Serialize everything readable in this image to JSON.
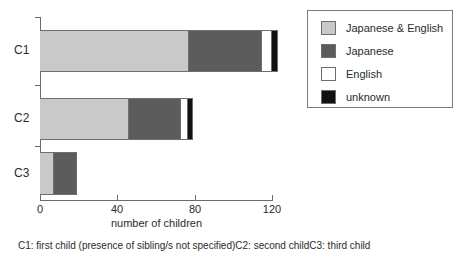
{
  "chart_data": {
    "type": "bar",
    "orientation": "horizontal",
    "stacked": true,
    "title": "",
    "xlabel": "number of children",
    "ylabel": "",
    "categories": [
      "C1",
      "C2",
      "C3"
    ],
    "xlim": [
      0,
      120
    ],
    "xticks": [
      0,
      40,
      80,
      120
    ],
    "xtick_labels": [
      "0",
      "40",
      "80",
      "120"
    ],
    "grid": false,
    "legend_position": "top-right",
    "series": [
      {
        "name": "Japanese & English",
        "color": "#c9c9c9",
        "values": [
          77,
          46,
          7
        ]
      },
      {
        "name": "Japanese",
        "color": "#5c5c5c",
        "values": [
          38,
          27,
          12
        ]
      },
      {
        "name": "English",
        "color": "#ffffff",
        "values": [
          5,
          3.5,
          0
        ]
      },
      {
        "name": "unknown",
        "color": "#111111",
        "values": [
          3,
          2.5,
          0
        ]
      }
    ],
    "totals": [
      123,
      79,
      19
    ],
    "annotations": [
      "C1: first child (presence of sibling/s not specified)",
      "C2: second child",
      "C3: third child"
    ]
  },
  "legend": {
    "items": [
      {
        "label": "Japanese & English",
        "color": "#c9c9c9"
      },
      {
        "label": "Japanese",
        "color": "#5c5c5c"
      },
      {
        "label": "English",
        "color": "#ffffff"
      },
      {
        "label": "unknown",
        "color": "#111111"
      }
    ]
  },
  "axis": {
    "x_title": "number of children",
    "x_tick_labels": [
      "0",
      "40",
      "80",
      "120"
    ],
    "y_tick_labels": [
      "C1",
      "C2",
      "C3"
    ]
  },
  "footnote": {
    "c1": "C1: first child (presence of sibling/s not specified)",
    "c2": "C2: second child",
    "c3": "C3: third child"
  }
}
